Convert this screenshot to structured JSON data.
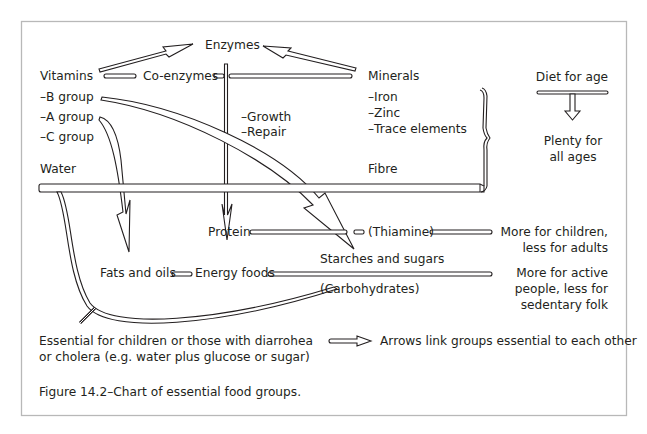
{
  "figure": {
    "caption": "Figure 14.2–Chart of  essential food groups."
  },
  "nodes": {
    "enzymes": "Enzymes",
    "vitamins": "Vitamins",
    "co_enzymes": "Co-enzymes",
    "minerals": "Minerals",
    "vitamin_groups": [
      "–B group",
      "–A group",
      "–C group"
    ],
    "protein_roles": [
      "–Growth",
      "–Repair"
    ],
    "mineral_items": [
      "–Iron",
      "–Zinc",
      "–Trace elements"
    ],
    "water": "Water",
    "fibre": "Fibre",
    "protein": "Protein",
    "thiamine": "(Thiamine)",
    "fats_and_oils": "Fats and oils",
    "energy_foods": "Energy foods",
    "starches_and_sugars": "Starches and sugars",
    "carbohydrates": "(Carbohydrates)"
  },
  "diet_for_age": {
    "heading": "Diet for age",
    "plenty_lines": [
      "Plenty for",
      "all ages"
    ],
    "protein_note": [
      "More for children,",
      "less for adults"
    ],
    "energy_note": [
      "More for active",
      "people, less for",
      "sedentary folk"
    ]
  },
  "water_note": [
    "Essential for children or those with diarrohea",
    "or cholera (e.g. water plus glucose or sugar)"
  ],
  "legend": {
    "arrow_meaning": "Arrows link groups essential to each other"
  },
  "colors": {
    "ink": "#231f20",
    "frame": "#b8b8b8",
    "background": "#ffffff"
  }
}
